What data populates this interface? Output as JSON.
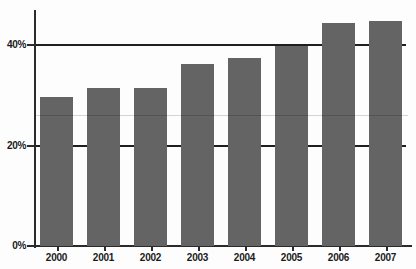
{
  "chart_data": {
    "type": "bar",
    "title": "",
    "subtitle": "",
    "xlabel": "",
    "ylabel": "",
    "categories": [
      "2000",
      "2001",
      "2002",
      "2003",
      "2004",
      "2005",
      "2006",
      "2007"
    ],
    "values": [
      29.6,
      31.5,
      31.5,
      36.3,
      37.5,
      39.8,
      44.4,
      44.8
    ],
    "series": [
      {
        "name": "",
        "values": [
          29.6,
          31.5,
          31.5,
          36.3,
          37.5,
          39.8,
          44.4,
          44.8
        ]
      }
    ],
    "ylim": [
      0,
      49
    ],
    "yticks": [
      0,
      20,
      40
    ],
    "ytick_labels": [
      "0%",
      "20%",
      "40%"
    ],
    "xtick_labels": [
      "2000",
      "2001",
      "2002",
      "2003",
      "2004",
      "2005",
      "2006",
      "2007"
    ],
    "grid": true,
    "gridlines_at": [
      20,
      40
    ],
    "legend": false,
    "legend_position": "none",
    "bar_color": "#646464",
    "axis_color": "#2b2b2b",
    "gridline_color": "#1f1f1f",
    "background_color": "#ffffff",
    "annotations": []
  },
  "axes": {
    "y_labels": [
      "40%",
      "20%",
      "0%"
    ],
    "x_labels": [
      "2000",
      "2001",
      "2002",
      "2003",
      "2004",
      "2005",
      "2006",
      "2007"
    ]
  }
}
